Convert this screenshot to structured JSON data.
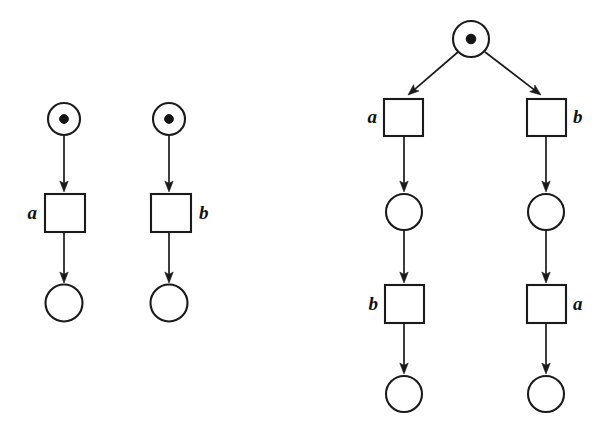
{
  "figure": {
    "name": "petri-net-comparison-figure",
    "kind": "petri-net-diagram",
    "background_color": "#ffffff",
    "stroke_color": "#1a1a1a",
    "token_color": "#141414",
    "width": 604,
    "height": 438
  },
  "diagrams": [
    {
      "id": "left-net",
      "name": "two-independent-sequences-net",
      "places": [
        {
          "id": "L1-p0",
          "name": "place-marked-left-top",
          "cx": 64,
          "cy": 119,
          "r": 16,
          "tokens": 1,
          "token_r": 4.4
        },
        {
          "id": "L1-p1",
          "name": "place-left-bottom",
          "cx": 64,
          "cy": 303,
          "r": 18.5,
          "tokens": 0,
          "token_r": 0
        },
        {
          "id": "L2-p0",
          "name": "place-marked-right-top",
          "cx": 169,
          "cy": 119,
          "r": 16,
          "tokens": 1,
          "token_r": 4.4
        },
        {
          "id": "L2-p1",
          "name": "place-right-bottom",
          "cx": 169,
          "cy": 303,
          "r": 18.5,
          "tokens": 0,
          "token_r": 0
        }
      ],
      "transitions": [
        {
          "id": "L1-t0",
          "name": "transition-a-left",
          "x": 45,
          "y": 194,
          "w": 40,
          "h": 38,
          "label": "a",
          "label_x": 37,
          "label_y": 219,
          "label_anchor": "end"
        },
        {
          "id": "L2-t0",
          "name": "transition-b-left",
          "x": 151,
          "y": 194,
          "w": 40,
          "h": 38,
          "label": "b",
          "label_x": 199,
          "label_y": 219,
          "label_anchor": "start"
        }
      ],
      "arcs": [
        {
          "id": "L1-a0",
          "name": "arc-place-to-transition-a",
          "x1": 64,
          "y1": 135,
          "x2": 64,
          "y2": 192
        },
        {
          "id": "L1-a1",
          "name": "arc-transition-a-to-place",
          "x1": 64,
          "y1": 232,
          "x2": 64,
          "y2": 283
        },
        {
          "id": "L2-a0",
          "name": "arc-place-to-transition-b",
          "x1": 169,
          "y1": 135,
          "x2": 169,
          "y2": 192
        },
        {
          "id": "L2-a1",
          "name": "arc-transition-b-to-place",
          "x1": 169,
          "y1": 232,
          "x2": 169,
          "y2": 283
        }
      ]
    },
    {
      "id": "right-net",
      "name": "interleaved-choice-net",
      "places": [
        {
          "id": "R-p0",
          "name": "place-marked-root",
          "cx": 471,
          "cy": 39,
          "r": 18,
          "tokens": 1,
          "token_r": 4.8
        },
        {
          "id": "R-p1",
          "name": "place-left-branch-middle",
          "cx": 404,
          "cy": 212,
          "r": 18,
          "tokens": 0,
          "token_r": 0
        },
        {
          "id": "R-p2",
          "name": "place-right-branch-middle",
          "cx": 546,
          "cy": 212,
          "r": 18,
          "tokens": 0,
          "token_r": 0
        },
        {
          "id": "R-p3",
          "name": "place-left-branch-bottom",
          "cx": 404,
          "cy": 394,
          "r": 18,
          "tokens": 0,
          "token_r": 0
        },
        {
          "id": "R-p4",
          "name": "place-right-branch-bottom",
          "cx": 546,
          "cy": 394,
          "r": 18,
          "tokens": 0,
          "token_r": 0
        }
      ],
      "transitions": [
        {
          "id": "R-t0",
          "name": "transition-a-left-branch-top",
          "x": 384,
          "y": 99,
          "w": 39,
          "h": 37,
          "label": "a",
          "label_x": 377,
          "label_y": 123,
          "label_anchor": "end"
        },
        {
          "id": "R-t1",
          "name": "transition-b-right-branch-top",
          "x": 527,
          "y": 99,
          "w": 39,
          "h": 37,
          "label": "b",
          "label_x": 573,
          "label_y": 123,
          "label_anchor": "start"
        },
        {
          "id": "R-t2",
          "name": "transition-b-left-branch-bottom",
          "x": 385,
          "y": 285,
          "w": 39,
          "h": 38,
          "label": "b",
          "label_x": 378,
          "label_y": 310,
          "label_anchor": "end"
        },
        {
          "id": "R-t3",
          "name": "transition-a-right-branch-bottom",
          "x": 527,
          "y": 285,
          "w": 39,
          "h": 38,
          "label": "a",
          "label_x": 573,
          "label_y": 310,
          "label_anchor": "start"
        }
      ],
      "arcs": [
        {
          "id": "R-a0",
          "name": "arc-root-to-transition-a",
          "x1": 458,
          "y1": 52,
          "x2": 408,
          "y2": 95
        },
        {
          "id": "R-a1",
          "name": "arc-root-to-transition-b",
          "x1": 485,
          "y1": 52,
          "x2": 541,
          "y2": 95
        },
        {
          "id": "R-a2",
          "name": "arc-transition-a-to-place-left",
          "x1": 404,
          "y1": 136,
          "x2": 404,
          "y2": 192
        },
        {
          "id": "R-a3",
          "name": "arc-transition-b-to-place-right",
          "x1": 546,
          "y1": 136,
          "x2": 546,
          "y2": 192
        },
        {
          "id": "R-a4",
          "name": "arc-place-left-to-transition-b",
          "x1": 404,
          "y1": 230,
          "x2": 404,
          "y2": 283
        },
        {
          "id": "R-a5",
          "name": "arc-place-right-to-transition-a",
          "x1": 546,
          "y1": 230,
          "x2": 546,
          "y2": 283
        },
        {
          "id": "R-a6",
          "name": "arc-transition-b-to-place-left-bottom",
          "x1": 404,
          "y1": 323,
          "x2": 404,
          "y2": 374
        },
        {
          "id": "R-a7",
          "name": "arc-transition-a-to-place-right-bottom",
          "x1": 546,
          "y1": 323,
          "x2": 546,
          "y2": 374
        }
      ]
    }
  ],
  "labels": {
    "a": "a",
    "b": "b"
  }
}
